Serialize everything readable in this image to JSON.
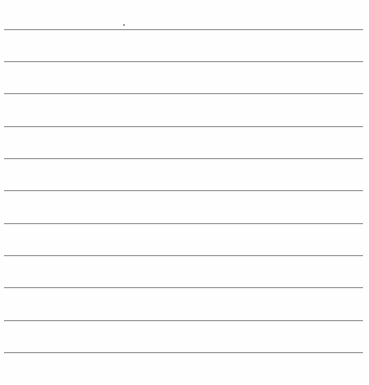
{
  "document": {
    "type": "lined-paper",
    "line_color": "#9c9c9c",
    "background_color": "#fefefe",
    "lines": [
      {
        "y": 29
      },
      {
        "y": 61
      },
      {
        "y": 93
      },
      {
        "y": 126
      },
      {
        "y": 158
      },
      {
        "y": 190
      },
      {
        "y": 223
      },
      {
        "y": 255
      },
      {
        "y": 287
      },
      {
        "y": 320
      },
      {
        "y": 352
      }
    ],
    "text": ""
  }
}
